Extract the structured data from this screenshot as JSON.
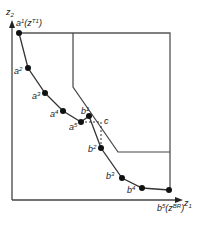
{
  "axes": {
    "y_label": "z",
    "y_sub": "2",
    "x_label": "z",
    "x_sub": "1"
  },
  "points": {
    "a1": {
      "label": "a",
      "sup": "1",
      "extra": "(z",
      "extra_sup": "T1",
      "close": ")"
    },
    "a2": {
      "label": "a",
      "sup": "2"
    },
    "a3": {
      "label": "a",
      "sup": "3"
    },
    "a4": {
      "label": "a",
      "sup": "4"
    },
    "a5": {
      "label": "a",
      "sup": "5"
    },
    "b1": {
      "label": "b",
      "sup": "1"
    },
    "b2": {
      "label": "b",
      "sup": "2"
    },
    "b3": {
      "label": "b",
      "sup": "3"
    },
    "b4": {
      "label": "b",
      "sup": "4"
    },
    "b5": {
      "label": "b",
      "sup": "5",
      "extra": "(z",
      "extra_sup": "BR",
      "close": ")"
    },
    "c": {
      "label": "c"
    }
  },
  "colors": {
    "line": "#333333",
    "frame": "#555555",
    "point": "#111111"
  }
}
